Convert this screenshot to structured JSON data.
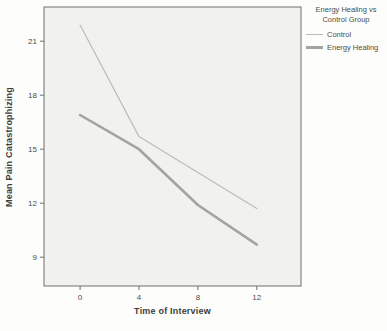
{
  "chart_data": {
    "type": "line",
    "title": "",
    "xlabel": "Time of Interview",
    "ylabel": "Mean Pain Catastrophizing",
    "x": [
      0,
      4,
      8,
      12
    ],
    "xticks": [
      0,
      4,
      8,
      12
    ],
    "yticks": [
      9,
      12,
      15,
      18,
      21
    ],
    "xlim": [
      -2.45,
      15.0
    ],
    "ylim": [
      7.4,
      22.9
    ],
    "grid": false,
    "plot_bg": "#f1f1ee",
    "axis_color": "#6e6e6b",
    "text_color": "#4c4c4a",
    "legend": {
      "title": "Energy Healing vs Control Group",
      "position": "top-right"
    },
    "series": [
      {
        "name": "Control",
        "values": [
          21.9,
          15.7,
          13.7,
          11.7
        ],
        "color": "#bcbcba",
        "width": 1.2
      },
      {
        "name": "Energy Healing",
        "values": [
          16.9,
          15.0,
          11.9,
          9.7
        ],
        "color": "#a5a3a0",
        "width": 2.6
      }
    ]
  }
}
